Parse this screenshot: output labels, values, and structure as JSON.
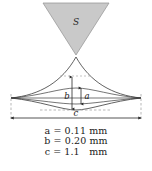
{
  "figure": {
    "source_label": "S",
    "dimension_labels": {
      "a": "a",
      "b": "b",
      "c": "c"
    },
    "colors": {
      "triangle_fill": "#c9c9c9",
      "triangle_stroke": "#9a9a9a",
      "curve_stroke": "#3a3a3a",
      "dashed_stroke": "#9a9a9a",
      "text": "#1a1a1a",
      "background": "#ffffff"
    },
    "legend": [
      {
        "symbol": "a",
        "equals": "=",
        "value": "0.11",
        "unit": "mm"
      },
      {
        "symbol": "b",
        "equals": "=",
        "value": "0.20",
        "unit": "mm"
      },
      {
        "symbol": "c",
        "equals": "=",
        "value": "1.1",
        "unit": "mm"
      }
    ],
    "legend_lines": [
      "a = 0.11 mm",
      "b = 0.20 mm",
      "c = 1.1   mm"
    ]
  }
}
